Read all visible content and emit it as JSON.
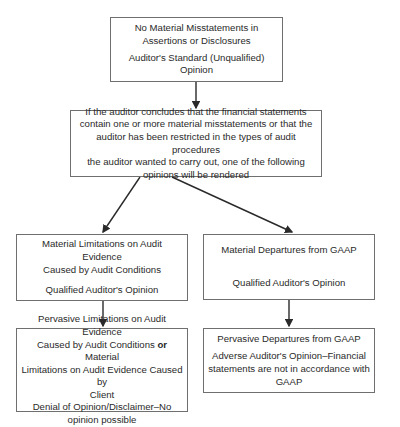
{
  "colors": {
    "border": "#6f6f6f",
    "arrow": "#2a2a2a",
    "text": "#2a2a2a"
  },
  "nodes": {
    "top": {
      "title_line1": "No Material Misstatements in",
      "title_line2": "Assertions or Disclosures",
      "opinion": "Auditor's Standard (Unqualified) Opinion"
    },
    "condition": {
      "line1": "If the auditor concludes that the financial statements",
      "line2": "contain one or more material misstatements or that the",
      "line3": "auditor has been restricted in the types of audit procedures",
      "line4": "the auditor wanted to carry out, one of the following",
      "line5": "opinions will be rendered"
    },
    "left_mid": {
      "title_line1": "Material Limitations on Audit Evidence",
      "title_line2": "Caused by Audit Conditions",
      "opinion": "Qualified Auditor's Opinion"
    },
    "right_mid": {
      "title": "Material Departures from GAAP",
      "opinion": "Qualified Auditor's Opinion"
    },
    "left_bottom": {
      "title_line1": "Pervasive Limitations on Audit Evidence",
      "title_line2a": "Caused by Audit Conditions ",
      "title_or": "or",
      "title_line2b": " Material",
      "title_line3": "Limitations on Audit Evidence Caused by",
      "title_line4": "Client",
      "opinion_line1": "Denial of Opinion/Disclaimer–No",
      "opinion_line2": "opinion possible"
    },
    "right_bottom": {
      "title": "Pervasive Departures from GAAP",
      "opinion_line1": "Adverse Auditor's Opinion–Financial",
      "opinion_line2": "statements are not in accordance with",
      "opinion_line3": "GAAP"
    }
  }
}
